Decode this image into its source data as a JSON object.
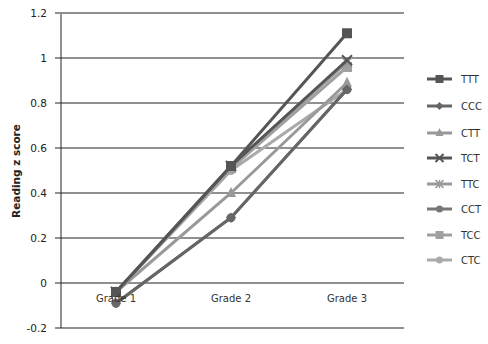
{
  "chart_data": {
    "type": "line",
    "title": "",
    "xlabel": "",
    "ylabel": "Reading z score",
    "ylim": [
      -0.2,
      1.2
    ],
    "yticks": [
      1.2,
      1,
      0.8,
      0.6,
      0.4,
      0.2,
      0,
      -0.2
    ],
    "ytick_labels": [
      "1.2",
      "1",
      "0.8",
      "0.6",
      "0.4",
      "0.2",
      "0",
      "-0.2"
    ],
    "grid": true,
    "legend_position": "right",
    "categories": [
      "Grade 1",
      "Grade 2",
      "Grade 3"
    ],
    "series": [
      {
        "name": "TTT",
        "marker": "square",
        "color": "#555555",
        "values": [
          -0.04,
          0.52,
          1.11
        ]
      },
      {
        "name": "CCC",
        "marker": "diamond",
        "color": "#666666",
        "values": [
          -0.09,
          0.29,
          0.86
        ]
      },
      {
        "name": "CTT",
        "marker": "triangle",
        "color": "#999999",
        "values": [
          -0.04,
          0.4,
          0.89
        ]
      },
      {
        "name": "TCT",
        "marker": "x",
        "color": "#555555",
        "values": [
          -0.04,
          0.52,
          0.99
        ]
      },
      {
        "name": "TTC",
        "marker": "star",
        "color": "#999999",
        "values": [
          -0.04,
          0.52,
          0.98
        ]
      },
      {
        "name": "CCT",
        "marker": "circle",
        "color": "#777777",
        "values": [
          -0.09,
          0.29,
          0.86
        ]
      },
      {
        "name": "TCC",
        "marker": "square",
        "color": "#a0a0a0",
        "values": [
          -0.04,
          0.51,
          0.96
        ]
      },
      {
        "name": "CTC",
        "marker": "circle",
        "color": "#aaaaaa",
        "values": [
          -0.04,
          0.5,
          0.86
        ]
      }
    ]
  }
}
